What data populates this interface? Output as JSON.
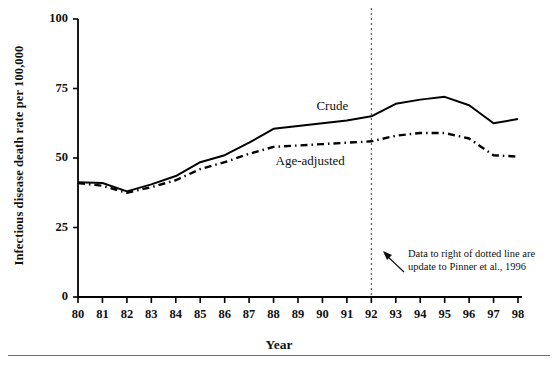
{
  "chart_data": {
    "type": "line",
    "title": "",
    "xlabel": "Year",
    "ylabel": "Infectious disease death rate per 100,000",
    "x": [
      80,
      81,
      82,
      83,
      84,
      85,
      86,
      87,
      88,
      89,
      90,
      91,
      92,
      93,
      94,
      95,
      96,
      97,
      98
    ],
    "categories": [
      "80",
      "81",
      "82",
      "83",
      "84",
      "85",
      "86",
      "87",
      "88",
      "89",
      "90",
      "91",
      "92",
      "93",
      "94",
      "95",
      "96",
      "97",
      "98"
    ],
    "xtick_labels": [
      "80",
      "81",
      "82",
      "83",
      "84",
      "85",
      "86",
      "87",
      "88",
      "89",
      "90",
      "91",
      "92",
      "93",
      "94",
      "95",
      "96",
      "97",
      "98"
    ],
    "ytick_labels": [
      "0",
      "25",
      "50",
      "75",
      "100"
    ],
    "yticks": [
      0,
      25,
      50,
      75,
      100
    ],
    "ylim": [
      0,
      100
    ],
    "xlim": [
      80,
      98
    ],
    "grid": false,
    "legend_position": "inline-labels",
    "series": [
      {
        "name": "Crude",
        "style": "solid",
        "color": "#000000",
        "values": [
          41.3,
          41.0,
          38.0,
          40.5,
          43.5,
          48.5,
          51.0,
          55.5,
          60.5,
          61.5,
          62.5,
          63.5,
          65.0,
          69.5,
          71.0,
          72.0,
          69.0,
          62.5,
          64.0
        ]
      },
      {
        "name": "Age-adjusted",
        "style": "dash-dot",
        "color": "#000000",
        "values": [
          41.0,
          40.0,
          37.5,
          39.5,
          42.0,
          46.0,
          48.5,
          51.5,
          54.0,
          54.5,
          55.0,
          55.5,
          56.0,
          58.0,
          59.0,
          59.0,
          57.0,
          51.0,
          50.5
        ]
      }
    ],
    "annotations": [
      {
        "name": "dotted-divider",
        "type": "vertical-dotted-line",
        "x": 92,
        "label": ""
      },
      {
        "name": "pinner-note",
        "type": "text-with-arrow",
        "text_line_1": "Data to right of dotted line are",
        "text_line_2": "update to Pinner et al., 1996"
      }
    ],
    "series_inline_labels": [
      {
        "name": "Crude",
        "text": "Crude"
      },
      {
        "name": "Age-adjusted",
        "text": "Age-adjusted"
      }
    ]
  }
}
